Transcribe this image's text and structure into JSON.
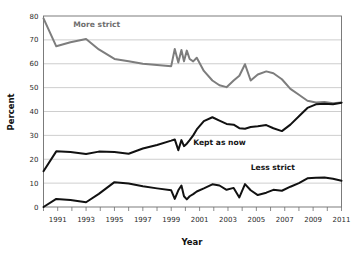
{
  "chart_data": {
    "type": "line",
    "title": "",
    "xlabel": "Year",
    "ylabel": "Percent",
    "xlim": [
      1990,
      2011
    ],
    "ylim": [
      0,
      80
    ],
    "grid": true,
    "legend_position": "inline-annotations",
    "x_tick_labels": [
      "1991",
      "1993",
      "1995",
      "1997",
      "1999",
      "2001",
      "2003",
      "2005",
      "2007",
      "2009",
      "2011"
    ],
    "x_tick_values": [
      1991,
      1993,
      1995,
      1997,
      1999,
      2001,
      2003,
      2005,
      2007,
      2009,
      2011
    ],
    "x_minor_tick_values": [
      1990,
      1992,
      1994,
      1996,
      1998,
      2000,
      2002,
      2004,
      2006,
      2008,
      2010
    ],
    "y_tick_labels": [
      "0",
      "10",
      "20",
      "30",
      "40",
      "50",
      "60",
      "70",
      "80"
    ],
    "y_tick_values": [
      0,
      10,
      20,
      30,
      40,
      50,
      60,
      70,
      80
    ],
    "series": [
      {
        "name": "More strict",
        "color": "#7d7d7d",
        "label_x": 1992.1,
        "label_y": 75.5,
        "x": [
          1990.0,
          1990.9,
          1991.9,
          1993.0,
          1993.9,
          1995.0,
          1996.0,
          1997.0,
          1998.0,
          1999.0,
          1999.25,
          1999.5,
          1999.72,
          1999.9,
          2000.1,
          2000.3,
          2000.55,
          2000.8,
          2001.3,
          2001.9,
          2002.4,
          2002.9,
          2003.4,
          2003.8,
          2004.2,
          2004.6,
          2005.1,
          2005.7,
          2006.2,
          2006.8,
          2007.4,
          2008.0,
          2008.6,
          2009.2,
          2009.8,
          2010.4,
          2011.0
        ],
        "y": [
          79.0,
          67.3,
          69.0,
          70.4,
          66.0,
          62.0,
          61.0,
          60.0,
          59.5,
          59.0,
          66.2,
          60.5,
          65.8,
          61.0,
          65.5,
          62.0,
          61.0,
          62.5,
          57.0,
          53.0,
          51.0,
          50.2,
          53.0,
          55.0,
          59.8,
          53.0,
          55.5,
          56.8,
          56.0,
          53.5,
          49.5,
          47.0,
          44.5,
          43.8,
          44.0,
          43.5,
          43.8
        ]
      },
      {
        "name": "Kept as now",
        "color": "#111111",
        "label_x": 2000.55,
        "label_y": 26.0,
        "x": [
          1990.0,
          1990.9,
          1991.9,
          1993.0,
          1993.9,
          1995.0,
          1996.0,
          1997.0,
          1998.0,
          1999.0,
          1999.25,
          1999.5,
          1999.72,
          1999.9,
          2000.1,
          2000.3,
          2000.55,
          2000.8,
          2001.3,
          2001.9,
          2002.4,
          2002.9,
          2003.4,
          2003.8,
          2004.2,
          2004.6,
          2005.1,
          2005.7,
          2006.2,
          2006.8,
          2007.4,
          2008.0,
          2008.6,
          2009.2,
          2009.8,
          2010.4,
          2011.0
        ],
        "y": [
          15.0,
          23.3,
          23.0,
          22.2,
          23.2,
          23.0,
          22.3,
          24.5,
          26.0,
          27.8,
          28.3,
          23.8,
          28.0,
          25.5,
          26.5,
          28.0,
          30.0,
          32.5,
          36.0,
          37.6,
          36.2,
          34.8,
          34.5,
          33.0,
          32.8,
          33.5,
          33.8,
          34.3,
          33.0,
          31.8,
          34.5,
          38.0,
          41.5,
          43.0,
          43.2,
          43.0,
          43.7
        ]
      },
      {
        "name": "Less strict",
        "color": "#111111",
        "label_x": 2004.6,
        "label_y": 15.5,
        "x": [
          1990.0,
          1990.9,
          1991.9,
          1993.0,
          1993.9,
          1995.0,
          1996.0,
          1997.0,
          1998.0,
          1999.0,
          1999.25,
          1999.5,
          1999.72,
          1999.9,
          2000.1,
          2000.3,
          2000.55,
          2000.8,
          2001.3,
          2001.9,
          2002.4,
          2002.9,
          2003.4,
          2003.8,
          2004.2,
          2004.6,
          2005.1,
          2005.7,
          2006.2,
          2006.8,
          2007.4,
          2008.0,
          2008.6,
          2009.2,
          2009.8,
          2010.4,
          2011.0
        ],
        "y": [
          0.0,
          3.4,
          2.9,
          2.0,
          5.5,
          10.4,
          9.8,
          8.7,
          7.8,
          7.0,
          3.4,
          7.0,
          9.0,
          4.5,
          3.2,
          4.5,
          5.4,
          6.5,
          7.8,
          9.5,
          9.0,
          7.2,
          8.0,
          4.0,
          9.6,
          7.0,
          5.0,
          6.0,
          7.2,
          6.8,
          8.5,
          10.0,
          12.0,
          12.3,
          12.4,
          11.8,
          11.0
        ]
      }
    ]
  },
  "axis": {
    "ylabel": "Percent",
    "xlabel": "Year"
  }
}
